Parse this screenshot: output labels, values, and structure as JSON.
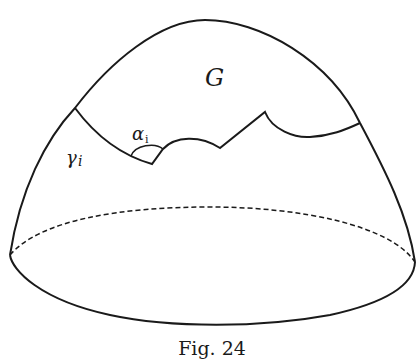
{
  "figure": {
    "caption": "Fig. 24",
    "labels": {
      "region": "G",
      "curve": "γ",
      "curve_sub": "i",
      "angle": "α",
      "angle_sub": "i"
    },
    "stroke_color": "#1a1a1a"
  }
}
